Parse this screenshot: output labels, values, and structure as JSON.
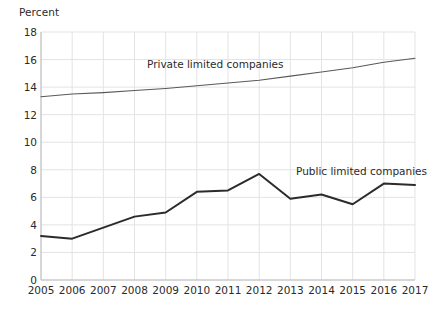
{
  "chart_data": {
    "type": "line",
    "title": "",
    "ylabel": "Percent",
    "xlabel": "",
    "categories": [
      "2005",
      "2006",
      "2007",
      "2008",
      "2009",
      "2010",
      "2011",
      "2012",
      "2013",
      "2014",
      "2015",
      "2016",
      "2017"
    ],
    "x": [
      2005,
      2006,
      2007,
      2008,
      2009,
      2010,
      2011,
      2012,
      2013,
      2014,
      2015,
      2016,
      2017
    ],
    "xlim": [
      2005,
      2017
    ],
    "ylim": [
      0,
      18
    ],
    "yticks": [
      0,
      2,
      4,
      6,
      8,
      10,
      12,
      14,
      16,
      18
    ],
    "ytick_labels": [
      "0",
      "2",
      "4",
      "6",
      "8",
      "10",
      "12",
      "14",
      "16",
      "18"
    ],
    "xtick_labels": [
      "2005",
      "2006",
      "2007",
      "2008",
      "2009",
      "2010",
      "2011",
      "2012",
      "2013",
      "2014",
      "2015",
      "2016",
      "2017"
    ],
    "grid": true,
    "grid_color": "#e3e3e3",
    "legend_position": "inline-annotations",
    "series": [
      {
        "name": "Private limited companies",
        "color": "#595959",
        "line_width": 1.1,
        "values": [
          13.3,
          13.5,
          13.6,
          13.75,
          13.9,
          14.1,
          14.3,
          14.5,
          14.8,
          15.1,
          15.4,
          15.8,
          16.1
        ]
      },
      {
        "name": "Public limited companies",
        "color": "#2b2b2b",
        "line_width": 2.0,
        "values": [
          3.2,
          3.0,
          3.8,
          4.6,
          4.9,
          6.4,
          6.5,
          7.7,
          5.9,
          6.2,
          5.5,
          7.0,
          6.9
        ]
      }
    ],
    "annotations": [
      {
        "text": "Private limited companies",
        "series": "Private limited companies"
      },
      {
        "text": "Public limited companies",
        "series": "Public limited companies"
      }
    ]
  },
  "colors": {
    "background": "#ffffff",
    "text": "#2b2b2b",
    "grid": "#e3e3e3",
    "axis": "#bdbdbd"
  }
}
